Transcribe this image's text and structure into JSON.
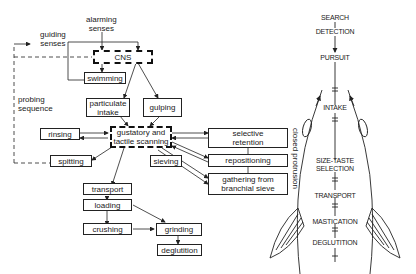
{
  "flow": {
    "alarming_senses": "alarming\nsenses",
    "alarming_1": "alarming",
    "alarming_2": "senses",
    "guiding_1": "guiding",
    "guiding_2": "senses",
    "probing_1": "probing",
    "probing_2": "sequence",
    "cns": "CNS",
    "swimming": "swimming",
    "particulate_1": "particulate",
    "particulate_2": "intake",
    "gulping": "gulping",
    "gustatory_1": "gustatory and",
    "gustatory_2": "tactile scanning",
    "rinsing": "rinsing",
    "spitting": "spitting",
    "sieving": "sieving",
    "selective_1": "selective",
    "selective_2": "retention",
    "repositioning": "repositioning",
    "gathering_1": "gathering from",
    "gathering_2": "branchial sieve",
    "closed_protrusion": "closed protrusion",
    "transport": "transport",
    "loading": "loading",
    "crushing": "crushing",
    "grinding": "grinding",
    "deglutition": "deglutition"
  },
  "fish": {
    "search": "SEARCH",
    "detection": "DETECTION",
    "pursuit": "PURSUIT",
    "intake": "INTAKE",
    "size_taste": "SIZE-TASTE",
    "selection": "SELECTION",
    "transport": "TRANSPORT",
    "mastication": "MASTICATION",
    "deglutition": "DEGLUTITION"
  }
}
